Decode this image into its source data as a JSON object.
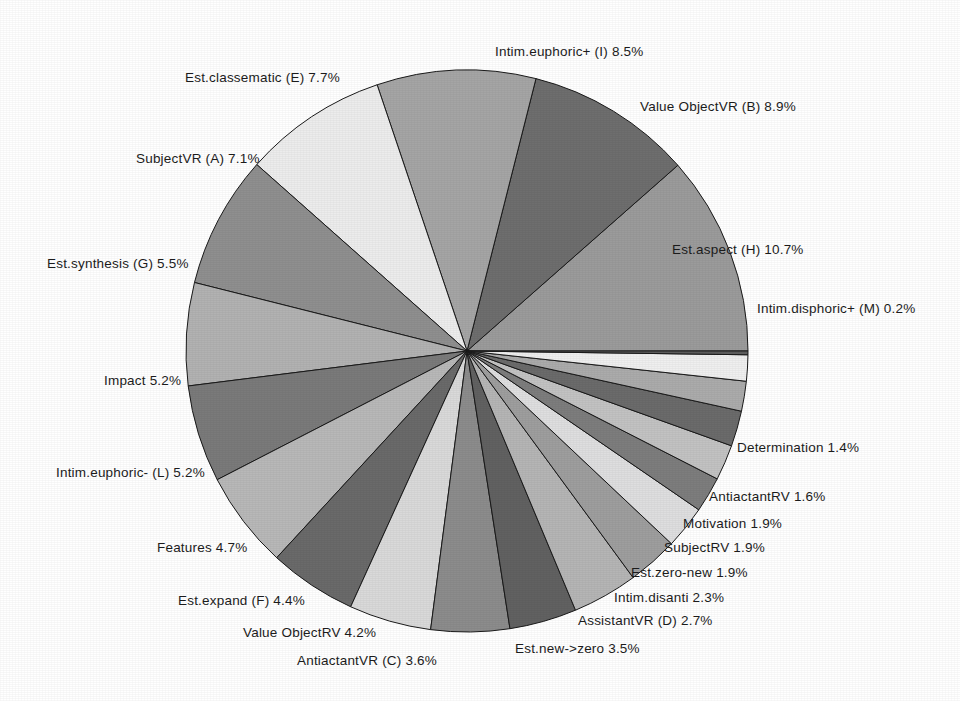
{
  "chart_data": {
    "type": "pie",
    "title": "",
    "xlabel": "",
    "ylabel": "",
    "legend_position": "none",
    "grid": false,
    "labels_show_percent": true,
    "start_angle_deg": 0,
    "direction": "counterclockwise",
    "center": {
      "x": 467,
      "y": 351
    },
    "radius": 281,
    "categories": [
      "Est.aspect (H)",
      "Value ObjectVR (B)",
      "Intim.euphoric+ (I)",
      "Est.classematic (E)",
      "SubjectVR (A)",
      "Est.synthesis (G)",
      "Impact",
      "Intim.euphoric- (L)",
      "Features",
      "Est.expand (F)",
      "Value ObjectRV",
      "AntiactantVR (C)",
      "Est.new->zero",
      "AssistantVR (D)",
      "Intim.disanti",
      "Est.zero-new",
      "SubjectRV",
      "Motivation",
      "AntiactantRV",
      "Determination",
      "Intim.disphoric+ (M)"
    ],
    "values": [
      10.7,
      8.9,
      8.5,
      7.7,
      7.1,
      5.5,
      5.2,
      5.2,
      4.7,
      4.4,
      4.2,
      3.6,
      3.5,
      2.7,
      2.3,
      1.9,
      1.9,
      1.9,
      1.6,
      1.4,
      0.2
    ],
    "value_suffix": "%",
    "slice_colors": [
      "#9b9b9b",
      "#6e6e6e",
      "#a5a5a5",
      "#ececec",
      "#8f8f8f",
      "#b2b2b2",
      "#7a7a7a",
      "#b8b8b8",
      "#6a6a6a",
      "#d9d9d9",
      "#8c8c8c",
      "#616161",
      "#b5b5b5",
      "#9e9e9e",
      "#dededf",
      "#7d7d7d",
      "#c2c2c2",
      "#6b6b6b",
      "#ababab",
      "#efefef",
      "#5e5e5e"
    ],
    "slice_labels": [
      {
        "text": "Est.aspect (H)  10.7%",
        "x": 672,
        "y": 254,
        "anchor": "start"
      },
      {
        "text": "Value ObjectVR (B)  8.9%",
        "x": 640,
        "y": 111,
        "anchor": "start"
      },
      {
        "text": "Intim.euphoric+ (I)  8.5%",
        "x": 495,
        "y": 56,
        "anchor": "start"
      },
      {
        "text": "Est.classematic (E)  7.7%",
        "x": 185,
        "y": 82,
        "anchor": "start"
      },
      {
        "text": "SubjectVR (A)  7.1%",
        "x": 136,
        "y": 163,
        "anchor": "start"
      },
      {
        "text": "Est.synthesis (G)  5.5%",
        "x": 47,
        "y": 268,
        "anchor": "start"
      },
      {
        "text": "Impact  5.2%",
        "x": 104,
        "y": 385,
        "anchor": "start"
      },
      {
        "text": "Intim.euphoric- (L)  5.2%",
        "x": 56,
        "y": 477,
        "anchor": "start"
      },
      {
        "text": "Features  4.7%",
        "x": 157,
        "y": 552,
        "anchor": "start"
      },
      {
        "text": "Est.expand (F)  4.4%",
        "x": 178,
        "y": 605,
        "anchor": "start"
      },
      {
        "text": "Value ObjectRV  4.2%",
        "x": 243,
        "y": 637,
        "anchor": "start"
      },
      {
        "text": "AntiactantVR (C)  3.6%",
        "x": 297,
        "y": 665,
        "anchor": "start"
      },
      {
        "text": "Est.new->zero  3.5%",
        "x": 515,
        "y": 653,
        "anchor": "start"
      },
      {
        "text": "AssistantVR (D)  2.7%",
        "x": 578,
        "y": 625,
        "anchor": "start"
      },
      {
        "text": "Intim.disanti  2.3%",
        "x": 614,
        "y": 602,
        "anchor": "start"
      },
      {
        "text": "Est.zero-new  1.9%",
        "x": 631,
        "y": 577,
        "anchor": "start"
      },
      {
        "text": "SubjectRV  1.9%",
        "x": 664,
        "y": 552,
        "anchor": "start"
      },
      {
        "text": "Motivation  1.9%",
        "x": 683,
        "y": 528,
        "anchor": "start"
      },
      {
        "text": "AntiactantRV  1.6%",
        "x": 709,
        "y": 501,
        "anchor": "start"
      },
      {
        "text": "Determination  1.4%",
        "x": 737,
        "y": 452,
        "anchor": "start"
      },
      {
        "text": "Intim.disphoric+ (M)  0.2%",
        "x": 757,
        "y": 313,
        "anchor": "start"
      }
    ]
  },
  "figure": {
    "background_color": "#ffffff",
    "outline_color": "#1a1a1a"
  }
}
